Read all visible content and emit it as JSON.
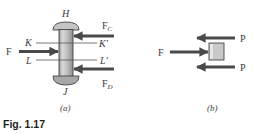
{
  "figure": {
    "caption": "Fig. 1.17",
    "colors": {
      "arrow": "#4a4a4a",
      "bolt_fill": "#b8b8b8",
      "bolt_highlight": "#d9d9d9",
      "bolt_stroke": "#444444",
      "section_line": "#555555",
      "block_fill": "#c4c4c4"
    },
    "panel_a": {
      "sublabel": "(a)",
      "top_label": "H",
      "bottom_label": "J",
      "section_lines": [
        {
          "left": "K",
          "right": "K′"
        },
        {
          "left": "L",
          "right": "L′"
        }
      ],
      "forces": {
        "left": {
          "label": "F",
          "sub": ""
        },
        "right_top": {
          "label": "F",
          "sub": "C"
        },
        "right_bottom": {
          "label": "F",
          "sub": "D"
        }
      }
    },
    "panel_b": {
      "sublabel": "(b)",
      "forces": {
        "left": "F",
        "right_top": "P",
        "right_bottom": "P"
      }
    }
  }
}
